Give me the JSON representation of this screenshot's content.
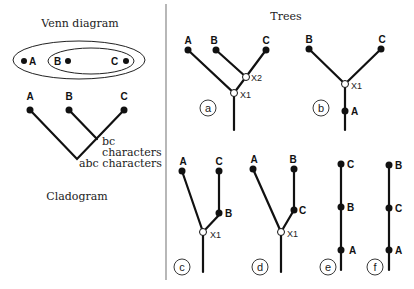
{
  "left_panel": {
    "venn_title": "Venn diagram",
    "venn_labels": [
      "A",
      "B",
      "C"
    ],
    "cladogram_title": "Cladogram",
    "cladogram_taxa": [
      "A",
      "B",
      "C"
    ],
    "bc_label_line1": "bc",
    "bc_label_line2": "characters",
    "abc_label": "abc characters"
  },
  "right_panel": {
    "title": "Trees",
    "trees": [
      {
        "id": "a",
        "tips": [
          "A",
          "B",
          "C"
        ],
        "nodes": [
          "X2",
          "X1"
        ]
      },
      {
        "id": "b",
        "tips": [
          "B",
          "C"
        ],
        "nodes": [
          "X1"
        ],
        "stem": "A"
      },
      {
        "id": "c",
        "tips": [
          "A",
          "C"
        ],
        "nodes": [
          "X1"
        ],
        "inner": "B"
      },
      {
        "id": "d",
        "tips": [
          "A",
          "B"
        ],
        "nodes": [
          "X1"
        ],
        "inner": "C"
      },
      {
        "id": "e",
        "chain": [
          "C",
          "B",
          "A"
        ]
      },
      {
        "id": "f",
        "chain": [
          "B",
          "C",
          "A"
        ]
      }
    ]
  }
}
